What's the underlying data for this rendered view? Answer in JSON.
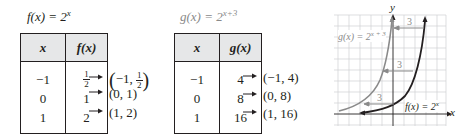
{
  "f_panel": {
    "title_fn": "f(x) = 2",
    "title_exp": "x",
    "table": {
      "headers": [
        "x",
        "f(x)"
      ],
      "rows": [
        {
          "x": "−1",
          "y_num": "1",
          "y_den": "2",
          "y": "1/2"
        },
        {
          "x": "0",
          "y": "1"
        },
        {
          "x": "1",
          "y": "2"
        }
      ]
    },
    "points": [
      {
        "pre": "−1, ",
        "num": "1",
        "den": "2",
        "label": "(−1, 1/2)"
      },
      {
        "label": "(0, 1)"
      },
      {
        "label": "(1, 2)"
      }
    ]
  },
  "g_panel": {
    "title_fn": "g(x) = 2",
    "title_exp": "x+3",
    "table": {
      "headers": [
        "x",
        "g(x)"
      ],
      "rows": [
        {
          "x": "−1",
          "y": "4"
        },
        {
          "x": "0",
          "y": "8"
        },
        {
          "x": "1",
          "y": "16"
        }
      ]
    },
    "points": [
      {
        "label": "(−1, 4)"
      },
      {
        "label": "(0, 8)"
      },
      {
        "label": "(1, 16)"
      }
    ]
  },
  "graph": {
    "x_axis_label": "x",
    "y_axis_label": "y",
    "g_label": "g(x) = 2",
    "g_label_exp": "x + 3",
    "f_label": "f(x) = 2",
    "f_label_exp": "x",
    "shift_labels": [
      "3",
      "3",
      "3"
    ],
    "colors": {
      "f_curve": "#231f20",
      "g_curve": "#8a8a8a",
      "grid": "#cfd0d2",
      "shift_arrow": "#8a8a8a"
    }
  }
}
